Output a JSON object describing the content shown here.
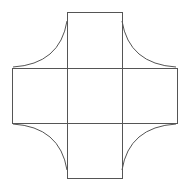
{
  "diagram": {
    "stroke_color": "#555555",
    "background_color": "#ffffff",
    "stroke_width": 1,
    "grid": {
      "x_lines": [
        12,
        67,
        122,
        177
      ],
      "y_lines": [
        12,
        68,
        123,
        178
      ]
    },
    "squares": [
      {
        "id": "top",
        "x": 67,
        "y": 12,
        "w": 55,
        "h": 56
      },
      {
        "id": "left",
        "x": 12,
        "y": 68,
        "w": 55,
        "h": 55
      },
      {
        "id": "center",
        "x": 67,
        "y": 68,
        "w": 55,
        "h": 55
      },
      {
        "id": "right",
        "x": 122,
        "y": 68,
        "w": 55,
        "h": 55
      },
      {
        "id": "bottom",
        "x": 67,
        "y": 123,
        "w": 55,
        "h": 55
      }
    ],
    "arcs": [
      {
        "id": "top-left",
        "d": "M 13 67 Q 60 64 67 21"
      },
      {
        "id": "top-right",
        "d": "M 122 21 Q 129 64 176 67"
      },
      {
        "id": "bottom-left",
        "d": "M 13 124 Q 60 127 67 170"
      },
      {
        "id": "bottom-right",
        "d": "M 122 170 Q 129 127 176 124"
      }
    ]
  }
}
